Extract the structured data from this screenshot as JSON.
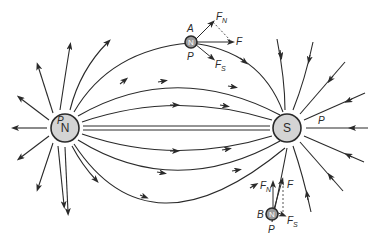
{
  "diagram": {
    "poles": {
      "north": {
        "label": "N"
      },
      "south": {
        "label": "S"
      }
    },
    "field_labels": {
      "left_p": "P",
      "right_p": "P"
    },
    "point_a": {
      "label": "A",
      "pole_label": "N",
      "p_label": "P",
      "forces": {
        "fn": "F",
        "fn_sub": "N",
        "f": "F",
        "fs": "F",
        "fs_sub": "S"
      }
    },
    "point_b": {
      "label": "B",
      "pole_label": "N",
      "p_label": "P",
      "forces": {
        "fn": "F",
        "fn_sub": "N",
        "f": "F",
        "fs": "F",
        "fs_sub": "S"
      }
    },
    "line_color": "#2a2a2a",
    "pole_fill": "#d4d4d4"
  }
}
